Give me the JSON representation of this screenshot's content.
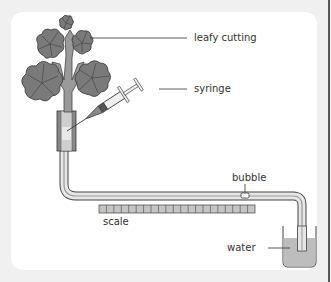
{
  "diagram": {
    "labels": {
      "leafy_cutting": "leafy cutting",
      "syringe": "syringe",
      "bubble": "bubble",
      "scale": "scale",
      "water": "water"
    },
    "scale_segments": 21,
    "colors": {
      "background": "#f0f0f0",
      "panel": "#ffffff",
      "leaf_fill": "#7a7a7a",
      "stem_fill": "#9a9a9a",
      "outline": "#444444",
      "water_fill": "#bdbdbd",
      "tube_fill": "#d8d8d8",
      "scale_fill": "#c4c4c4"
    }
  }
}
